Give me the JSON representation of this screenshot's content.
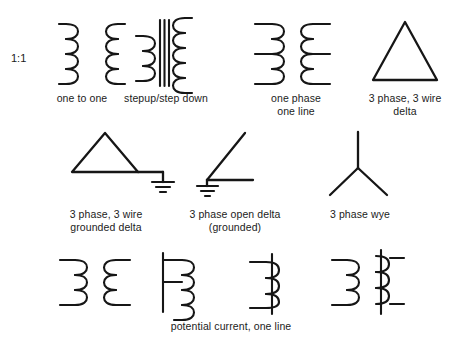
{
  "figure": {
    "background_color": "#ffffff",
    "ink_color": "#161616"
  },
  "rows": [
    {
      "name": "row-1",
      "items": [
        {
          "id": "one-to-one",
          "symbol": "two-winding-coil-pair",
          "ratio_label": "1:1",
          "caption": "one to one"
        },
        {
          "id": "stepup-stepdown",
          "symbol": "two-winding-coil-pair-with-iron-core",
          "caption": "stepup/step down"
        },
        {
          "id": "one-phase-one-line",
          "symbol": "two-winding-coil-pair-with-center-taps",
          "caption": "one phase\none line"
        },
        {
          "id": "three-phase-three-wire-delta",
          "symbol": "delta-triangle",
          "caption": "3 phase, 3 wire\ndelta"
        }
      ]
    },
    {
      "name": "row-2",
      "items": [
        {
          "id": "three-phase-three-wire-grounded-delta",
          "symbol": "delta-triangle-with-ground",
          "caption": "3 phase, 3 wire\ngrounded delta"
        },
        {
          "id": "three-phase-open-delta-grounded",
          "symbol": "open-delta-with-ground",
          "caption": "3 phase open delta\n(grounded)"
        },
        {
          "id": "three-phase-wye",
          "symbol": "wye-three-leg",
          "caption": "3 phase wye"
        }
      ]
    },
    {
      "name": "row-3",
      "items": [
        {
          "id": "potential-transformer",
          "symbol": "two-winding-coil-pair",
          "caption": ""
        },
        {
          "id": "potential-transformer-one-line",
          "symbol": "coil-with-bus-line",
          "caption": ""
        },
        {
          "id": "current-transformer-one-line",
          "symbol": "coil-on-through-line",
          "caption": ""
        },
        {
          "id": "current-transformer",
          "symbol": "coil-pair-on-through-line",
          "caption": ""
        }
      ],
      "caption": "potential current, one line"
    }
  ],
  "labels": {
    "ratio_1_1": "1:1",
    "one_to_one": "one to one",
    "stepup_stepdown": "stepup/step down",
    "one_phase_one_line": "one phase\none line",
    "delta_3ph_3wire": "3 phase, 3 wire\ndelta",
    "grounded_delta": "3 phase, 3 wire\ngrounded delta",
    "open_delta_grounded": "3 phase open delta\n(grounded)",
    "wye_3ph": "3 phase wye",
    "potential_current_one_line": "potential current, one line"
  }
}
